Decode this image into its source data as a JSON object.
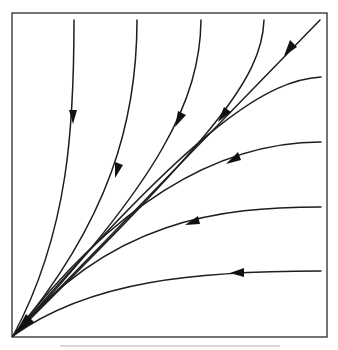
{
  "diagram": {
    "type": "phase-portrait",
    "colors": {
      "frame": "#3a3a3a",
      "trajectory": "#1e1e1e",
      "arrowhead": "#111111",
      "background": "#ffffff"
    },
    "frame": {
      "x": 12,
      "y": 13,
      "width": 315,
      "height": 324
    },
    "origin": {
      "x": 13,
      "y": 336
    },
    "trajectories": [
      {
        "id": "top-1",
        "entry": [
          74,
          20
        ],
        "arrow": [
          73,
          118
        ],
        "arrow_dir": "down"
      },
      {
        "id": "top-2",
        "entry": [
          137,
          20
        ],
        "arrow": [
          118,
          172
        ],
        "arrow_dir": "down-left"
      },
      {
        "id": "top-3",
        "entry": [
          201,
          20
        ],
        "arrow": [
          180,
          122
        ],
        "arrow_dir": "down-left"
      },
      {
        "id": "top-4",
        "entry": [
          264,
          20
        ],
        "arrow": [
          225,
          118
        ],
        "arrow_dir": "down-left"
      },
      {
        "id": "diagonal",
        "entry": [
          320,
          20
        ],
        "arrow": [
          291,
          50
        ],
        "arrow_dir": "down-left"
      },
      {
        "id": "right-1",
        "entry": [
          321,
          77
        ],
        "arrow": [
          232,
          160
        ],
        "arrow_dir": "left-down"
      },
      {
        "id": "right-2",
        "entry": [
          321,
          142
        ],
        "arrow": [
          190,
          222
        ],
        "arrow_dir": "left-down"
      },
      {
        "id": "right-3",
        "entry": [
          321,
          207
        ],
        "arrow": [
          238,
          273
        ],
        "arrow_dir": "left"
      },
      {
        "id": "right-4",
        "entry": [
          321,
          271
        ],
        "arrow": [
          238,
          273
        ],
        "arrow_dir": "left"
      }
    ],
    "arrow_count": 9
  }
}
